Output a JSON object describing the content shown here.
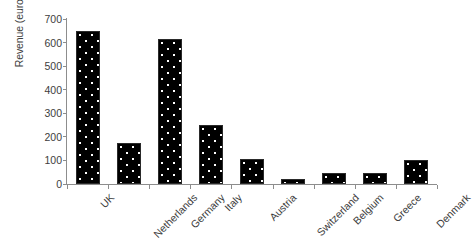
{
  "chart_data": {
    "type": "bar",
    "title": "",
    "subtitle": "",
    "xlabel": "",
    "ylabel": "Revenue (euros per capita)",
    "categories": [
      "UK",
      "Netherlands",
      "Germany",
      "Italy",
      "Austria",
      "Switzerland",
      "Belgium",
      "Greece",
      "Denmark"
    ],
    "values": [
      650,
      175,
      615,
      250,
      105,
      20,
      45,
      45,
      100
    ],
    "ylim": [
      0,
      700
    ],
    "yticks": [
      0,
      100,
      200,
      300,
      400,
      500,
      600,
      700
    ],
    "ytick_labels": [
      "0",
      "100",
      "200",
      "300",
      "400",
      "500",
      "600",
      "700"
    ],
    "grid": false,
    "legend": false,
    "legend_position": "none",
    "series": [
      {
        "name": "Revenue",
        "values": [
          650,
          175,
          615,
          250,
          105,
          20,
          45,
          45,
          100
        ]
      }
    ],
    "bar_fill_color": "#000000",
    "bar_pattern": "white-dots",
    "axis_color": "#8d8d8d",
    "text_color": "#3d3d3d",
    "background_color": "#ffffff",
    "xtick_label_rotation": -45
  }
}
